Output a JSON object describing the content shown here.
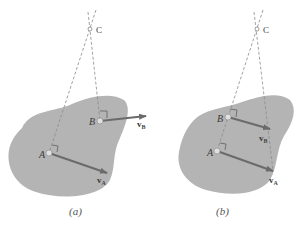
{
  "colors": {
    "body_fill": "#b4b4b4",
    "dashed_line": "#8a8a8a",
    "arrow": "#6b6b6b",
    "point_fill": "#e0e0e0",
    "text": "#3a3a3a"
  },
  "figures": [
    {
      "id": "a",
      "caption": "(a)",
      "labels": {
        "C": "C",
        "A": "A",
        "B": "B",
        "vA_main": "v",
        "vA_sub": "A",
        "vB_main": "v",
        "vB_sub": "B"
      }
    },
    {
      "id": "b",
      "caption": "(b)",
      "labels": {
        "C": "C",
        "A": "A",
        "B": "B",
        "vA_main": "v",
        "vA_sub": "A",
        "vB_main": "v",
        "vB_sub": "B"
      }
    }
  ]
}
